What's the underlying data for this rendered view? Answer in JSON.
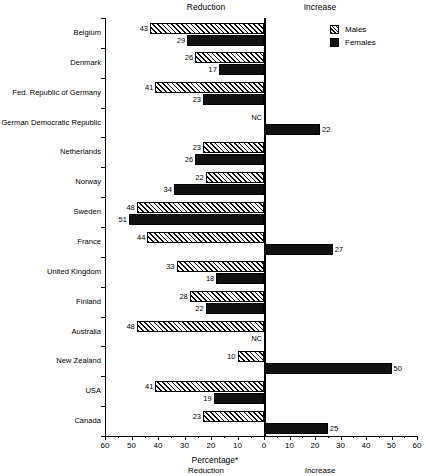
{
  "headers": {
    "top_left": "Reduction",
    "top_right": "Increase",
    "bottom_left": "Reduction",
    "bottom_right": "Increase"
  },
  "legend": {
    "males_label": "Males",
    "females_label": "Females",
    "males_pattern": "diagonal-hatch",
    "females_color": "#111111"
  },
  "axis": {
    "x_title": "Percentage*",
    "tick_labels": [
      "60",
      "50",
      "40",
      "30",
      "20",
      "10",
      "0",
      "10",
      "20",
      "30",
      "40",
      "50",
      "60"
    ],
    "no_change_marker": "NC"
  },
  "chart_data": {
    "type": "bar",
    "title": "",
    "subtitle": "",
    "xlabel": "Percentage*",
    "ylabel": "",
    "orientation": "horizontal",
    "diverging": true,
    "xlim": [
      -60,
      60
    ],
    "grid": false,
    "legend_position": "top-right",
    "categories": [
      "Belgium",
      "Denmark",
      "Fed. Republic of Germany",
      "German Democratic Republic",
      "Netherlands",
      "Norway",
      "Sweden",
      "France",
      "United Kingdom",
      "Finland",
      "Australia",
      "New Zealand",
      "USA",
      "Canada"
    ],
    "series": [
      {
        "name": "Males",
        "values": [
          43,
          26,
          41,
          null,
          23,
          22,
          48,
          44,
          33,
          28,
          48,
          10,
          41,
          23
        ],
        "directions": [
          "reduction",
          "reduction",
          "reduction",
          "nc",
          "reduction",
          "reduction",
          "reduction",
          "reduction",
          "reduction",
          "reduction",
          "reduction",
          "reduction",
          "reduction",
          "reduction"
        ],
        "labels": [
          "43",
          "26",
          "41",
          "NC",
          "23",
          "22",
          "48",
          "44",
          "33",
          "28",
          "48",
          "10",
          "41",
          "23"
        ]
      },
      {
        "name": "Females",
        "values": [
          29,
          17,
          23,
          22,
          26,
          34,
          51,
          27,
          18,
          22,
          null,
          50,
          19,
          25
        ],
        "directions": [
          "reduction",
          "reduction",
          "reduction",
          "increase",
          "reduction",
          "reduction",
          "reduction",
          "increase",
          "reduction",
          "reduction",
          "nc",
          "increase",
          "reduction",
          "increase"
        ],
        "labels": [
          "29",
          "17",
          "23",
          "22",
          "26",
          "34",
          "51",
          "27",
          "18",
          "22",
          "NC",
          "50",
          "19",
          "25"
        ]
      }
    ]
  }
}
